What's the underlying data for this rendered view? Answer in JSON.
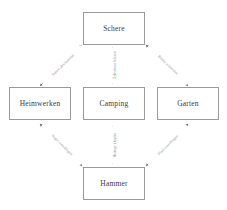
{
  "diagram": {
    "background_color": "#ffffff",
    "node_border_color": "#9a9a9a",
    "edge_color": "#8d8d8d",
    "label_color": "#8d8d8d",
    "nodes": [
      {
        "id": "schere",
        "label": "Schere"
      },
      {
        "id": "heimwerken",
        "label": "Heimwerken"
      },
      {
        "id": "camping",
        "label": "Camping"
      },
      {
        "id": "garten",
        "label": "Garten"
      },
      {
        "id": "hammer",
        "label": "Hammer"
      }
    ],
    "edges": [
      {
        "id": "schere-heimwerken",
        "from": "Schere",
        "to": "Heimwerken",
        "label": "Tapete abschneiden",
        "arrow": "double"
      },
      {
        "id": "schere-camping",
        "from": "Schere",
        "to": "Camping",
        "label": "Zeltschnur kürzen",
        "arrow": "double"
      },
      {
        "id": "schere-garten",
        "from": "Schere",
        "to": "Garten",
        "label": "Blume schneiden",
        "arrow": "double"
      },
      {
        "id": "hammer-heimwerken",
        "from": "Hammer",
        "to": "Heimwerken",
        "label": "Nagel einschlagen",
        "arrow": "double"
      },
      {
        "id": "hammer-camping",
        "from": "Hammer",
        "to": "Camping",
        "label": "Heringe klopfen",
        "arrow": "double"
      },
      {
        "id": "hammer-garten",
        "from": "Hammer",
        "to": "Garten",
        "label": "Pfahl einschlagen",
        "arrow": "double"
      }
    ]
  }
}
